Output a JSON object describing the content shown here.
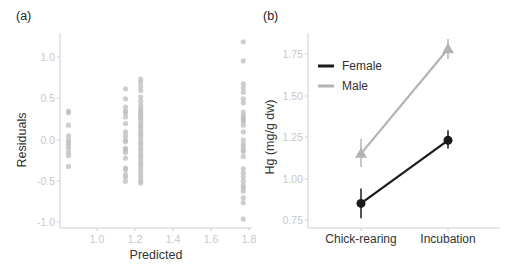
{
  "chart_data": [
    {
      "panel": "(a)",
      "type": "scatter",
      "title": "",
      "xlabel": "Predicted",
      "ylabel": "Residuals",
      "xlim": [
        0.82,
        1.82
      ],
      "ylim": [
        -1.08,
        1.25
      ],
      "xticks": [
        "1.0",
        "1.2",
        "1.4",
        "1.6",
        "1.8"
      ],
      "yticks": [
        "-1.0",
        "-0.5",
        "0.0",
        "0.5",
        "1.0"
      ],
      "grid": false,
      "point_color": "#bdbdbd",
      "series": [
        {
          "x": 0.85,
          "y": [
            0.35,
            0.33,
            0.18,
            0.05,
            0.0,
            -0.03,
            -0.06,
            -0.1,
            -0.15,
            -0.19,
            -0.32
          ]
        },
        {
          "x": 1.15,
          "y": [
            0.62,
            0.5,
            0.4,
            0.35,
            0.33,
            0.28,
            0.2,
            0.1,
            0.05,
            0.0,
            -0.02,
            -0.1,
            -0.12,
            -0.15,
            -0.22,
            -0.34,
            -0.36,
            -0.42,
            -0.45,
            -0.5
          ]
        },
        {
          "x": 1.23,
          "y": [
            0.74,
            0.7,
            0.65,
            0.6,
            0.52,
            0.47,
            0.42,
            0.38,
            0.35,
            0.32,
            0.3,
            0.27,
            0.24,
            0.2,
            0.17,
            0.14,
            0.1,
            0.07,
            0.04,
            0.0,
            -0.03,
            -0.06,
            -0.1,
            -0.13,
            -0.17,
            -0.2,
            -0.23,
            -0.27,
            -0.3,
            -0.34,
            -0.38,
            -0.42,
            -0.46,
            -0.5,
            -0.52
          ]
        },
        {
          "x": 1.77,
          "y": [
            1.19,
            0.96,
            0.68,
            0.63,
            0.58,
            0.5,
            0.45,
            0.34,
            0.3,
            0.27,
            0.25,
            0.22,
            0.18,
            0.1,
            0.0,
            -0.05,
            -0.08,
            -0.12,
            -0.14,
            -0.2,
            -0.35,
            -0.4,
            -0.45,
            -0.5,
            -0.55,
            -0.58,
            -0.62,
            -0.7,
            -0.76,
            -0.96
          ]
        }
      ]
    },
    {
      "panel": "(b)",
      "type": "line",
      "title": "",
      "xlabel": "",
      "ylabel": "Hg (mg/g dw)",
      "categories": [
        "Chick-rearing",
        "Incubation"
      ],
      "ylim": [
        0.72,
        1.88
      ],
      "yticks": [
        "0.75",
        "1.00",
        "1.25",
        "1.50",
        "1.75"
      ],
      "grid": false,
      "legend_position": "top-left inside",
      "series": [
        {
          "name": "Female",
          "color": "#1a1a1a",
          "marker": "circle",
          "values": [
            0.85,
            1.23
          ],
          "err_low": [
            0.76,
            1.18
          ],
          "err_high": [
            0.94,
            1.29
          ]
        },
        {
          "name": "Male",
          "color": "#b3b3b3",
          "marker": "triangle",
          "values": [
            1.15,
            1.78
          ],
          "err_low": [
            1.07,
            1.72
          ],
          "err_high": [
            1.24,
            1.84
          ]
        }
      ]
    }
  ],
  "labels": {
    "panel_a": "(a)",
    "panel_b": "(b)",
    "a_xlabel": "Predicted",
    "a_ylabel": "Residuals",
    "b_ylabel": "Hg (mg/g dw)",
    "legend_female": "Female",
    "legend_male": "Male",
    "cat_1": "Chick-rearing",
    "cat_2": "Incubation",
    "a_xt": [
      "1.0",
      "1.2",
      "1.4",
      "1.6",
      "1.8"
    ],
    "a_yt": [
      "1.0",
      "0.5",
      "0.0",
      "-0.5",
      "-1.0"
    ],
    "b_yt": [
      "1.75",
      "1.50",
      "1.25",
      "1.00",
      "0.75"
    ]
  }
}
